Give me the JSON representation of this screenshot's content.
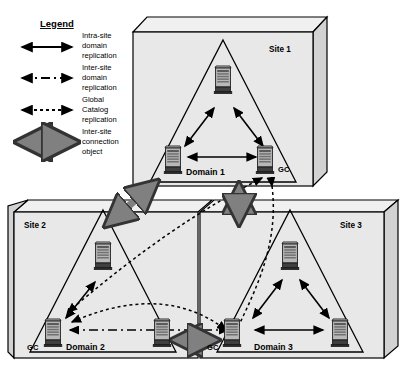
{
  "diagram": {
    "type": "network-topology",
    "legend": {
      "heading": "Legend",
      "items": [
        {
          "style": "solid-double-arrow",
          "label": "Intra-site\ndomain\nreplication",
          "line1": "Intra-site",
          "line2": "domain",
          "line3": "replication"
        },
        {
          "style": "dash-dot-double-arrow",
          "label": "Inter-site\ndomain\nreplication",
          "line1": "Inter-site",
          "line2": "domain",
          "line3": "replication"
        },
        {
          "style": "dotted-double-arrow",
          "label": "Global\nCatalog\nreplication",
          "line1": "Global",
          "line2": "Catalog",
          "line3": "replication"
        },
        {
          "style": "thick-gray-double-arrow",
          "label": "Inter-site\nconnection\nobject",
          "line1": "Inter-site",
          "line2": "connection",
          "line3": "object"
        }
      ]
    },
    "sites": [
      {
        "id": "site1",
        "label": "Site 1",
        "domain_label": "Domain 1",
        "gc_label": "GC",
        "server_count": 3
      },
      {
        "id": "site2",
        "label": "Site 2",
        "domain_label": "Domain 2",
        "gc_label": "GC",
        "server_count": 3
      },
      {
        "id": "site3",
        "label": "Site 3",
        "domain_label": "Domain 3",
        "gc_label": "GC",
        "server_count": 3
      }
    ],
    "colors": {
      "box_fill": "#e8e8e8",
      "box_top_fill": "#f0f0f0",
      "box_side_fill": "#d2d2d2",
      "outline": "#000000",
      "thick_arrow": "#808080",
      "thick_arrow_outline": "#333333",
      "server_body": "#b8b8b8",
      "server_dark": "#4a4a4a",
      "background": "#ffffff"
    }
  }
}
